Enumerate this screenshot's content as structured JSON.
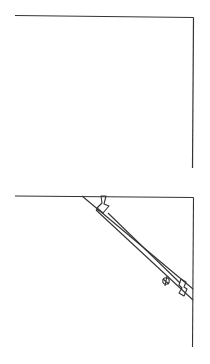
{
  "diagram": {
    "stroke_color": "#333333",
    "background": "#ffffff",
    "figures": [
      {
        "id": "corner-empty",
        "label": ""
      },
      {
        "id": "corner-with-brace",
        "label": ""
      }
    ]
  }
}
